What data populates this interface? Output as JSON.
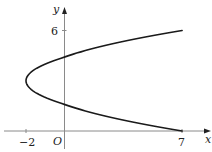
{
  "diagram": {
    "type": "function-graph",
    "axes": {
      "x_label": "x",
      "y_label": "y",
      "origin_label": "O",
      "x_ticks": [
        {
          "value": -2,
          "label": "−2"
        },
        {
          "value": 7,
          "label": "7"
        }
      ],
      "y_ticks": [
        {
          "value": 6,
          "label": "6"
        }
      ]
    },
    "curve": {
      "equation": "x = (y - 3)^2 - 2",
      "vertex": [
        -2,
        3
      ],
      "endpoints": [
        [
          7,
          0
        ],
        [
          7,
          6
        ]
      ],
      "y_range": [
        0,
        6
      ]
    },
    "colors": {
      "axis": "#8a8a8a",
      "curve": "#1a1a1a",
      "text": "#222222"
    }
  }
}
